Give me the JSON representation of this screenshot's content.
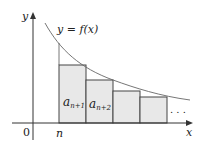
{
  "diagram": {
    "curve_label": "y = f(x)",
    "y_axis_label": "y",
    "x_axis_label": "x",
    "origin_label": "0",
    "n_label": "n",
    "rect_labels": [
      "a",
      "a"
    ],
    "rect_subscripts": [
      "n+1",
      "n+2"
    ],
    "ellipsis": ". . .",
    "colors": {
      "rect_fill": "#e8e8e8",
      "rect_stroke": "#444444",
      "curve": "#555555",
      "axis": "#333333"
    }
  }
}
